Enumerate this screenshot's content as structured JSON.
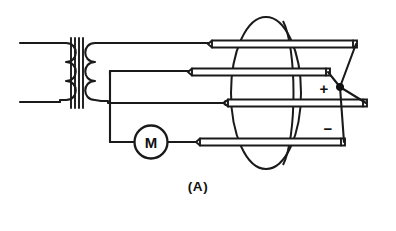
{
  "figure": {
    "caption": "(A)",
    "title": "",
    "type": "electrical-schematic",
    "background_color": "#ffffff",
    "line_color": "#1a1a1a"
  },
  "components": {
    "transformer": {
      "name": "transformer",
      "primary_label": "",
      "secondary_label": "",
      "primary_turns": 3,
      "secondary_turns": 3,
      "core_bars": 4
    },
    "motor": {
      "name": "motor",
      "label": "M"
    },
    "rectifier_tube": {
      "name": "mercury-arc-rectifier-tube",
      "electrode_count": 4,
      "envelope_shape": "oval"
    }
  },
  "terminals": {
    "positive": "+",
    "negative": "−"
  },
  "electrodes": [
    {
      "name": "electrode-1",
      "index": 1
    },
    {
      "name": "electrode-2",
      "index": 2
    },
    {
      "name": "electrode-3",
      "index": 3
    },
    {
      "name": "electrode-4",
      "index": 4
    }
  ]
}
